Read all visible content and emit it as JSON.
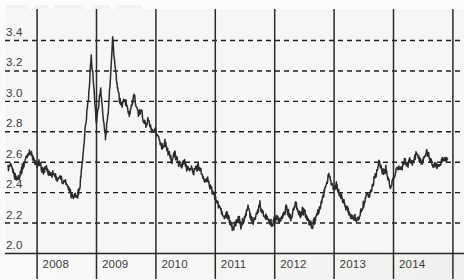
{
  "chart_data": {
    "type": "line",
    "title": "",
    "subtitle": "",
    "xlabel": "",
    "ylabel": "",
    "xlim": [
      2007.45,
      2014.93
    ],
    "ylim": [
      2.0,
      3.47
    ],
    "grid": true,
    "grid_style": {
      "horizontal": "dashed",
      "vertical": "solid",
      "baseline": "solid"
    },
    "legend": null,
    "legend_position": "none",
    "y_ticks": [
      "2.0",
      "2.2",
      "2.4",
      "2.6",
      "2.8",
      "3.0",
      "3.2",
      "3.4"
    ],
    "y_tick_values": [
      2.0,
      2.2,
      2.4,
      2.6,
      2.8,
      3.0,
      3.2,
      3.4
    ],
    "x_ticks": [
      "2008",
      "2009",
      "2010",
      "2011",
      "2012",
      "2013",
      "2014"
    ],
    "x_tick_values": [
      2008,
      2009,
      2010,
      2011,
      2012,
      2013,
      2014
    ],
    "x_tick_label_position": "between-gridlines",
    "series": [
      {
        "name": "price",
        "color": "#2b2b2b",
        "x": [
          2007.52,
          2007.56,
          2007.6,
          2007.64,
          2007.68,
          2007.72,
          2007.76,
          2007.8,
          2007.84,
          2007.88,
          2007.92,
          2007.96,
          2008.0,
          2008.04,
          2008.08,
          2008.12,
          2008.16,
          2008.2,
          2008.24,
          2008.28,
          2008.32,
          2008.36,
          2008.4,
          2008.44,
          2008.48,
          2008.52,
          2008.56,
          2008.6,
          2008.64,
          2008.68,
          2008.72,
          2008.76,
          2008.8,
          2008.84,
          2008.88,
          2008.92,
          2008.96,
          2009.0,
          2009.04,
          2009.08,
          2009.12,
          2009.16,
          2009.2,
          2009.24,
          2009.28,
          2009.32,
          2009.36,
          2009.4,
          2009.44,
          2009.48,
          2009.52,
          2009.56,
          2009.6,
          2009.64,
          2009.68,
          2009.72,
          2009.76,
          2009.8,
          2009.84,
          2009.88,
          2009.92,
          2009.96,
          2010.0,
          2010.04,
          2010.08,
          2010.12,
          2010.16,
          2010.2,
          2010.24,
          2010.28,
          2010.32,
          2010.36,
          2010.4,
          2010.44,
          2010.48,
          2010.52,
          2010.56,
          2010.6,
          2010.64,
          2010.68,
          2010.72,
          2010.76,
          2010.8,
          2010.84,
          2010.88,
          2010.92,
          2010.96,
          2011.0,
          2011.04,
          2011.08,
          2011.12,
          2011.16,
          2011.2,
          2011.24,
          2011.28,
          2011.32,
          2011.36,
          2011.4,
          2011.44,
          2011.48,
          2011.52,
          2011.56,
          2011.6,
          2011.64,
          2011.68,
          2011.72,
          2011.76,
          2011.8,
          2011.84,
          2011.88,
          2011.92,
          2011.96,
          2012.0,
          2012.04,
          2012.08,
          2012.12,
          2012.16,
          2012.2,
          2012.24,
          2012.28,
          2012.32,
          2012.36,
          2012.4,
          2012.44,
          2012.48,
          2012.52,
          2012.56,
          2012.6,
          2012.64,
          2012.68,
          2012.72,
          2012.76,
          2012.8,
          2012.84,
          2012.88,
          2012.92,
          2012.96,
          2013.0,
          2013.04,
          2013.08,
          2013.12,
          2013.16,
          2013.2,
          2013.24,
          2013.28,
          2013.32,
          2013.36,
          2013.4,
          2013.44,
          2013.48,
          2013.52,
          2013.56,
          2013.6,
          2013.64,
          2013.68,
          2013.72,
          2013.76,
          2013.8,
          2013.84,
          2013.88,
          2013.92,
          2013.96,
          2014.0,
          2014.04,
          2014.08,
          2014.12,
          2014.16,
          2014.2,
          2014.24,
          2014.28,
          2014.32,
          2014.36,
          2014.4,
          2014.44,
          2014.48,
          2014.52,
          2014.56,
          2014.6,
          2014.64,
          2014.68,
          2014.72,
          2014.76,
          2014.8,
          2014.84,
          2014.88,
          2014.92
        ],
        "y": [
          2.555,
          2.57,
          2.54,
          2.505,
          2.485,
          2.52,
          2.56,
          2.6,
          2.64,
          2.665,
          2.64,
          2.6,
          2.575,
          2.59,
          2.56,
          2.54,
          2.555,
          2.53,
          2.515,
          2.53,
          2.5,
          2.48,
          2.5,
          2.47,
          2.475,
          2.445,
          2.41,
          2.375,
          2.38,
          2.372,
          2.41,
          2.56,
          2.72,
          2.9,
          3.05,
          3.29,
          3.12,
          2.86,
          2.96,
          3.08,
          2.89,
          2.76,
          2.9,
          3.14,
          3.41,
          3.23,
          3.08,
          3.01,
          2.965,
          3.02,
          2.96,
          2.92,
          2.975,
          3.03,
          2.965,
          2.905,
          2.94,
          2.88,
          2.84,
          2.875,
          2.82,
          2.79,
          2.8,
          2.77,
          2.73,
          2.7,
          2.725,
          2.68,
          2.64,
          2.61,
          2.655,
          2.62,
          2.59,
          2.565,
          2.6,
          2.57,
          2.545,
          2.56,
          2.53,
          2.555,
          2.57,
          2.54,
          2.5,
          2.46,
          2.49,
          2.44,
          2.4,
          2.37,
          2.335,
          2.3,
          2.265,
          2.23,
          2.26,
          2.215,
          2.18,
          2.165,
          2.2,
          2.23,
          2.175,
          2.215,
          2.26,
          2.3,
          2.245,
          2.2,
          2.235,
          2.28,
          2.32,
          2.275,
          2.23,
          2.25,
          2.21,
          2.19,
          2.215,
          2.245,
          2.205,
          2.23,
          2.26,
          2.3,
          2.265,
          2.23,
          2.28,
          2.32,
          2.275,
          2.24,
          2.285,
          2.255,
          2.225,
          2.195,
          2.175,
          2.21,
          2.25,
          2.29,
          2.34,
          2.4,
          2.46,
          2.52,
          2.47,
          2.42,
          2.45,
          2.4,
          2.38,
          2.345,
          2.315,
          2.295,
          2.25,
          2.22,
          2.245,
          2.215,
          2.245,
          2.29,
          2.34,
          2.4,
          2.38,
          2.42,
          2.48,
          2.53,
          2.59,
          2.555,
          2.52,
          2.56,
          2.48,
          2.44,
          2.48,
          2.53,
          2.57,
          2.545,
          2.575,
          2.61,
          2.57,
          2.605,
          2.59,
          2.62,
          2.655,
          2.62,
          2.59,
          2.62,
          2.66,
          2.64,
          2.6,
          2.57,
          2.6,
          2.56,
          2.59,
          2.625,
          2.6,
          2.62
        ]
      }
    ],
    "notes": {
      "start_value": 2.56,
      "end_value": 3.21,
      "maximum": 3.42,
      "maximum_period": "2009",
      "minimum": 2.15,
      "minimum_period": "2010-2011"
    }
  },
  "axes": {
    "y_labels": [
      {
        "text": "3.4",
        "value": 3.4
      },
      {
        "text": "3.2",
        "value": 3.2
      },
      {
        "text": "3.0",
        "value": 3.0
      },
      {
        "text": "2.8",
        "value": 2.8
      },
      {
        "text": "2.6",
        "value": 2.6
      },
      {
        "text": "2.4",
        "value": 2.4
      },
      {
        "text": "2.2",
        "value": 2.2
      },
      {
        "text": "2.0",
        "value": 2.0
      }
    ],
    "x_labels": [
      {
        "text": "2008",
        "value": 2008
      },
      {
        "text": "2009",
        "value": 2009
      },
      {
        "text": "2010",
        "value": 2010
      },
      {
        "text": "2011",
        "value": 2011
      },
      {
        "text": "2012",
        "value": 2012
      },
      {
        "text": "2013",
        "value": 2013
      },
      {
        "text": "2014",
        "value": 2014
      }
    ]
  },
  "colors": {
    "line": "#2b2b2b",
    "grid_dashed": "#1f1f1f",
    "grid_solid": "#2a2a2a",
    "axis": "#262626",
    "text": "#3a3a3a",
    "background": "#f6f6f5"
  }
}
